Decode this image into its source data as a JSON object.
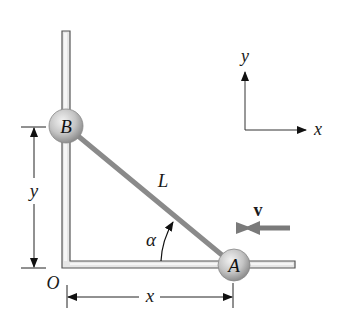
{
  "figure": {
    "type": "sliding-rod-mechanism"
  },
  "labels": {
    "ball_a": "A",
    "ball_b": "B",
    "rod": "L",
    "angle": "α",
    "velocity": "v",
    "origin": "O",
    "dim_x": "x",
    "dim_y": "y",
    "axis_x": "x",
    "axis_y": "y"
  },
  "colors": {
    "rail_fill": "#e6e6e6",
    "rail_stroke": "#555555",
    "rod": "#8a8a8a",
    "ball_light": "#e8e8e8",
    "ball_dark": "#9a9a9a",
    "velocity_arrow": "#7a7a7a",
    "line": "#222222"
  }
}
